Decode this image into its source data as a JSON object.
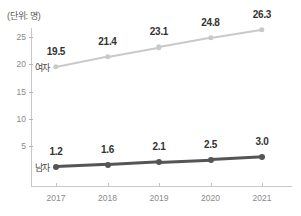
{
  "chart_data": {
    "type": "line",
    "title": "",
    "unit_label": "(단위: 명)",
    "xlabel": "",
    "ylabel": "",
    "categories": [
      "2017",
      "2018",
      "2019",
      "2020",
      "2021"
    ],
    "y_ticks": [
      "5",
      "10",
      "15",
      "20",
      "25"
    ],
    "y_tick_values": [
      5,
      10,
      15,
      20,
      25
    ],
    "ylim": [
      0,
      27.5
    ],
    "grid": false,
    "legend_position": "inline-left",
    "series": [
      {
        "name": "여자",
        "color": "#c9c9c9",
        "values": [
          19.5,
          21.4,
          23.1,
          24.8,
          26.3
        ],
        "labels": [
          "19.5",
          "21.4",
          "23.1",
          "24.8",
          "26.3"
        ]
      },
      {
        "name": "남자",
        "color": "#555555",
        "values": [
          1.2,
          1.6,
          2.1,
          2.5,
          3.0
        ],
        "labels": [
          "1.2",
          "1.6",
          "2.1",
          "2.5",
          "3.0"
        ]
      }
    ]
  },
  "axis": {
    "line_color": "#c8c8c8",
    "tick_color": "#b4b4b4",
    "tick_text_color": "#8a8a8a"
  }
}
